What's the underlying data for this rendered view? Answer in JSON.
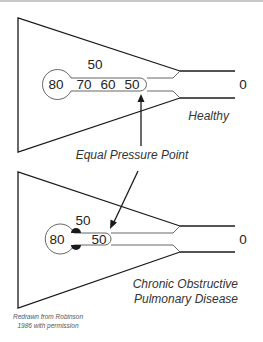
{
  "diagram": {
    "healthy": {
      "label": "Healthy",
      "alveolar_pressure": "80",
      "airway_pressures": [
        "70",
        "60",
        "50"
      ],
      "pleural_pressure": "50",
      "mouth_pressure": "0"
    },
    "copd": {
      "label_line1": "Chronic Obstructive",
      "label_line2": "Pulmonary Disease",
      "alveolar_pressure": "80",
      "airway_pressure": "50",
      "pleural_pressure": "50",
      "mouth_pressure": "0"
    },
    "annotation": "Equal Pressure Point",
    "credit_line1": "Redrawn from Robinson",
    "credit_line2": "1986 with permission",
    "colors": {
      "line": "#1a1a1a",
      "text": "#222222"
    }
  }
}
